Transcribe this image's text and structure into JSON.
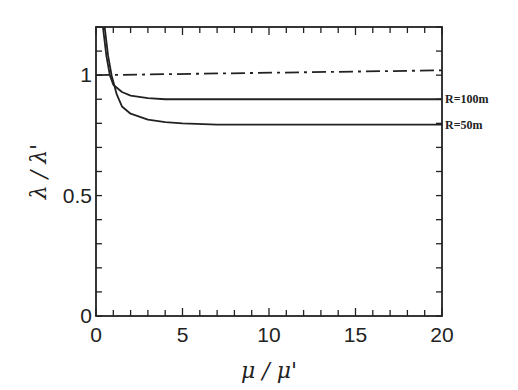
{
  "chart_data": {
    "type": "line",
    "title": "",
    "xlabel": "μ / μ'",
    "ylabel": "λ / λ'",
    "xlim": [
      0,
      20
    ],
    "ylim": [
      0,
      1.2
    ],
    "x_ticks": [
      "0",
      "5",
      "10",
      "15",
      "20"
    ],
    "y_ticks": [
      "0",
      "0.5",
      "1"
    ],
    "grid": false,
    "legend_position": "right, inline labels",
    "series": [
      {
        "name": "R=100m",
        "style": "solid",
        "x": [
          0.4,
          0.6,
          0.8,
          1,
          1.5,
          2,
          3,
          4,
          5,
          7,
          10,
          15,
          20
        ],
        "y": [
          1.2,
          1.08,
          1.0,
          0.96,
          0.93,
          0.915,
          0.905,
          0.9,
          0.9,
          0.9,
          0.9,
          0.9,
          0.9
        ]
      },
      {
        "name": "R=50m",
        "style": "solid",
        "x": [
          0.5,
          0.7,
          0.9,
          1.2,
          1.5,
          2,
          3,
          4,
          5,
          7,
          10,
          15,
          20
        ],
        "y": [
          1.2,
          1.08,
          1.0,
          0.92,
          0.87,
          0.84,
          0.815,
          0.805,
          0.8,
          0.795,
          0.795,
          0.795,
          0.795
        ]
      },
      {
        "name": "reference",
        "style": "dash-dot",
        "x": [
          0,
          20
        ],
        "y": [
          1.0,
          1.02
        ]
      }
    ]
  }
}
